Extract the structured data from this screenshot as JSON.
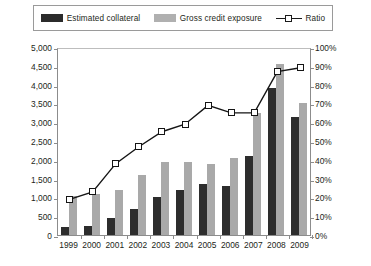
{
  "legend": {
    "items": [
      {
        "label": "Estimated collateral",
        "swatch": "dark-square-swatch",
        "color": "#2d2d2d"
      },
      {
        "label": "Gross credit  exposure",
        "swatch": "gray-square-swatch",
        "color": "#a9a9a9"
      },
      {
        "label": "Ratio",
        "swatch": "line-marker-swatch",
        "color": "#151515"
      }
    ]
  },
  "axes": {
    "y_left_title": "USD billions",
    "y_left_ticks": [
      "5,000",
      "4,500",
      "4,000",
      "3,500",
      "3,000",
      "2,500",
      "2,000",
      "1,500",
      "1,000",
      "500",
      "0"
    ],
    "y_right_ticks": [
      "100%",
      "90%",
      "80%",
      "70%",
      "60%",
      "50%",
      "40%",
      "30%",
      "20%",
      "10%",
      "0%"
    ]
  },
  "chart_data": {
    "type": "bar",
    "title": "",
    "subtitle": "",
    "xlabel": "",
    "ylabel": "USD billions",
    "y2label": "",
    "categories": [
      "1999",
      "2000",
      "2001",
      "2002",
      "2003",
      "2004",
      "2005",
      "2006",
      "2007",
      "2008",
      "2009"
    ],
    "series": [
      {
        "name": "Estimated collateral",
        "type": "bar",
        "axis": "left",
        "color": "#2d2d2d",
        "unit": "USD billions",
        "values": [
          200,
          250,
          450,
          700,
          1000,
          1200,
          1350,
          1300,
          2100,
          3900,
          3150
        ]
      },
      {
        "name": "Gross credit  exposure",
        "type": "bar",
        "axis": "left",
        "color": "#a9a9a9",
        "unit": "USD billions",
        "values": [
          1050,
          1100,
          1200,
          1600,
          1950,
          1950,
          1900,
          2050,
          3250,
          4550,
          3500
        ]
      },
      {
        "name": "Ratio",
        "type": "line",
        "axis": "right",
        "color": "#151515",
        "marker": "open-square",
        "unit": "%",
        "values": [
          20,
          24,
          39,
          48,
          56,
          60,
          70,
          66,
          66,
          88,
          90
        ]
      }
    ],
    "ylim": [
      0,
      5000
    ],
    "ytick_step": 500,
    "y2lim": [
      0,
      100
    ],
    "y2tick_step": 10,
    "grid": false,
    "legend_position": "top"
  }
}
